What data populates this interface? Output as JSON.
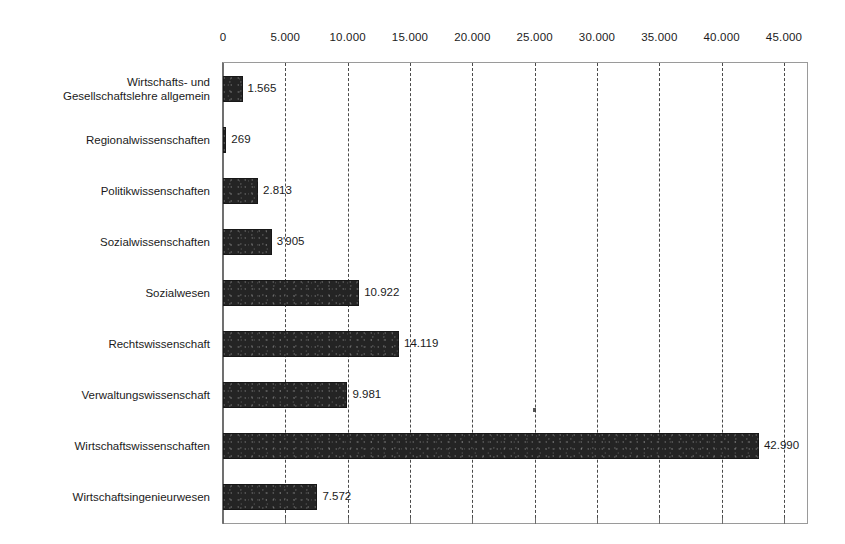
{
  "chart_data": {
    "type": "bar",
    "orientation": "horizontal",
    "title": "",
    "subtitle": "",
    "xlabel": "",
    "ylabel": "",
    "xlim": [
      0,
      45000
    ],
    "xtick_step": 5000,
    "grid": true,
    "grid_style": "dashed vertical",
    "legend": "none",
    "number_format": "de-DE (dot thousands separator)",
    "bar_color": "#242424",
    "plot_border_color": "#9a9a9a",
    "categories": [
      "Wirtschafts- und\nGesellschaftslehre allgemein",
      "Regionalwissenschaften",
      "Politikwissenschaften",
      "Sozialwissenschaften",
      "Sozialwesen",
      "Rechtswissenschaft",
      "Verwaltungswissenschaft",
      "Wirtschaftswissenschaften",
      "Wirtschaftsingenieurwesen"
    ],
    "values": [
      1565,
      269,
      2813,
      3905,
      10922,
      14119,
      9981,
      42990,
      7572
    ],
    "value_labels": [
      "1.565",
      "269",
      "2.813",
      "3'905",
      "10.922",
      "14.119",
      "9.981",
      "42.990",
      "7.572"
    ],
    "xticks": [
      0,
      5000,
      10000,
      15000,
      20000,
      25000,
      30000,
      35000,
      40000,
      45000
    ],
    "xtick_labels": [
      "0",
      "5.000",
      "10.000",
      "15.000",
      "20.000",
      "25.000",
      "30.000",
      "35.000",
      "40.000",
      "45.000"
    ]
  }
}
